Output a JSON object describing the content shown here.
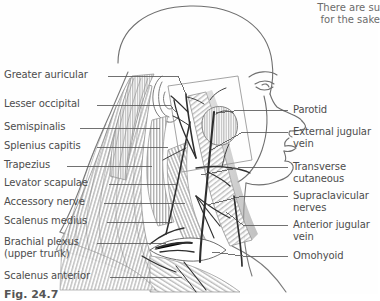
{
  "figure": {
    "caption": "Fig. 24.7",
    "top_note_line1": "There are su",
    "top_note_line2": "for the sake"
  },
  "labels_left": [
    {
      "id": "greater-auricular",
      "text": "Greater auricular",
      "x": 4,
      "y": 69,
      "line_x1": 108,
      "line_x2": 175,
      "line_y": 76,
      "target_x": 178,
      "target_y": 100
    },
    {
      "id": "lesser-occipital",
      "text": "Lesser occipital",
      "x": 4,
      "y": 98,
      "line_x1": 97,
      "line_x2": 172,
      "line_y": 105,
      "target_x": 175,
      "target_y": 112
    },
    {
      "id": "semispinalis",
      "text": "Semispinalis",
      "x": 4,
      "y": 121,
      "line_x1": 80,
      "line_x2": 160,
      "line_y": 128,
      "target_x": 160,
      "target_y": 128
    },
    {
      "id": "splenius-capitis",
      "text": "Splenius capitis",
      "x": 4,
      "y": 140,
      "line_x1": 97,
      "line_x2": 168,
      "line_y": 147,
      "target_x": 168,
      "target_y": 147
    },
    {
      "id": "trapezius",
      "text": "Trapezius",
      "x": 4,
      "y": 159,
      "line_x1": 67,
      "line_x2": 152,
      "line_y": 166,
      "target_x": 152,
      "target_y": 166
    },
    {
      "id": "levator-scapulae",
      "text": "Levator scapulae",
      "x": 4,
      "y": 177,
      "line_x1": 109,
      "line_x2": 178,
      "line_y": 184,
      "target_x": 178,
      "target_y": 184
    },
    {
      "id": "accessory-nerve",
      "text": "Accessory nerve",
      "x": 4,
      "y": 196,
      "line_x1": 104,
      "line_x2": 185,
      "line_y": 203,
      "target_x": 185,
      "target_y": 203
    },
    {
      "id": "scalenus-medius",
      "text": "Scalenus medius",
      "x": 4,
      "y": 215,
      "line_x1": 107,
      "line_x2": 172,
      "line_y": 222,
      "target_x": 172,
      "target_y": 222
    },
    {
      "id": "brachial-plexus",
      "text": "Brachial plexus",
      "text2": "(upper trunk)",
      "x": 4,
      "y": 236,
      "line_x1": 97,
      "line_x2": 166,
      "line_y": 243,
      "target_x": 166,
      "target_y": 243
    },
    {
      "id": "scalenus-anterior",
      "text": "Scalenus anterior",
      "x": 4,
      "y": 270,
      "line_x1": 110,
      "line_x2": 182,
      "line_y": 277,
      "target_x": 182,
      "target_y": 277
    }
  ],
  "labels_right": [
    {
      "id": "parotid",
      "text": "Parotid",
      "x": 293,
      "y": 104,
      "line_x1": 243,
      "line_x2": 288,
      "line_y": 110,
      "target_x": 243,
      "target_y": 110
    },
    {
      "id": "external-jugular-vein",
      "text": "External jugular",
      "text2": "vein",
      "x": 293,
      "y": 126,
      "line_x1": 243,
      "line_x2": 288,
      "line_y": 132,
      "target_x": 243,
      "target_y": 132
    },
    {
      "id": "transverse-cutaneous",
      "text": "Transverse",
      "text2": "cutaneous",
      "x": 293,
      "y": 161,
      "line_x1": 243,
      "line_x2": 288,
      "line_y": 167,
      "target_x": 243,
      "target_y": 167
    },
    {
      "id": "supraclavicular-nerves",
      "text": "Supraclavicular",
      "text2": "nerves",
      "x": 293,
      "y": 190,
      "line_x1": 243,
      "line_x2": 288,
      "line_y": 196,
      "target_x": 243,
      "target_y": 196
    },
    {
      "id": "anterior-jugular-vein",
      "text": "Anterior jugular",
      "text2": "vein",
      "x": 293,
      "y": 219,
      "line_x1": 243,
      "line_x2": 288,
      "line_y": 225,
      "target_x": 243,
      "target_y": 225
    },
    {
      "id": "omohyoid",
      "text": "Omohyoid",
      "x": 293,
      "y": 250,
      "line_x1": 243,
      "line_x2": 288,
      "line_y": 256,
      "target_x": 243,
      "target_y": 256
    }
  ],
  "colors": {
    "background": "#fefefe",
    "ink": "#4d4d4d",
    "outline": "#7a7a7a",
    "muscle_hatch": "#8a8a8a",
    "vessel_dark": "#2b2b2b",
    "leader": "#555555"
  }
}
